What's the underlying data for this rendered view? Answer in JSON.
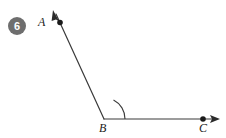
{
  "figure": {
    "problem_number": "6",
    "background_color": "#ffffff",
    "stroke_color": "#3a3a3a",
    "badge_color": "#6e6e6e",
    "badge_text_color": "#ffffff",
    "label_color": "#1a1a1a",
    "type": "angle-diagram",
    "points": [
      {
        "name": "A",
        "label": "A",
        "x": 60,
        "y": 22,
        "dot": true
      },
      {
        "name": "B",
        "label": "B",
        "x": 104,
        "y": 119,
        "dot": false
      },
      {
        "name": "C",
        "label": "C",
        "x": 203,
        "y": 119,
        "dot": true
      }
    ],
    "rays": [
      {
        "name": "ray-BA",
        "from": "B",
        "through": "A",
        "arrow_tip": {
          "x": 53,
          "y": 11
        }
      },
      {
        "name": "ray-BC",
        "from": "B",
        "through": "C",
        "arrow_tip": {
          "x": 219,
          "y": 119
        }
      }
    ],
    "arc": {
      "name": "angle-arc",
      "vertex": "B",
      "radius": 21
    }
  }
}
